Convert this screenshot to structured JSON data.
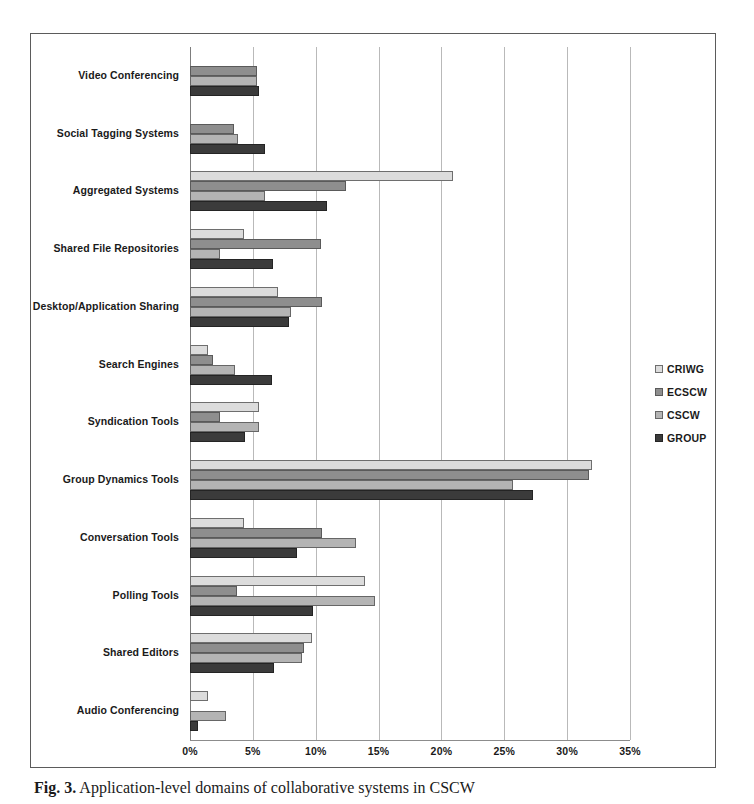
{
  "figure": {
    "caption_prefix": "Fig. 3.",
    "caption_text": "Application-level domains of collaborative systems in CSCW"
  },
  "legend": {
    "position": "right",
    "entries": [
      {
        "label": "CRIWG",
        "color": "#dcdcdc"
      },
      {
        "label": "ECSCW",
        "color": "#8e8e8e"
      },
      {
        "label": "CSCW",
        "color": "#b4b4b4"
      },
      {
        "label": "GROUP",
        "color": "#3b3b3b"
      }
    ]
  },
  "axis": {
    "ticks": [
      "0%",
      "5%",
      "10%",
      "15%",
      "20%",
      "25%",
      "30%",
      "35%"
    ],
    "min": 0,
    "max": 35
  },
  "chart_data": {
    "type": "bar",
    "orientation": "horizontal",
    "title": "",
    "xlabel": "",
    "ylabel": "",
    "xlim": [
      0,
      35
    ],
    "grid": true,
    "legend_position": "right",
    "categories": [
      "Video Conferencing",
      "Social Tagging Systems",
      "Aggregated Systems",
      "Shared File Repositories",
      "Desktop/Application Sharing",
      "Search Engines",
      "Syndication Tools",
      "Group Dynamics Tools",
      "Conversation Tools",
      "Polling Tools",
      "Shared Editors",
      "Audio Conferencing"
    ],
    "series": [
      {
        "name": "CRIWG",
        "values": [
          0.0,
          0.0,
          20.9,
          4.3,
          7.0,
          1.4,
          5.5,
          32.0,
          4.3,
          13.9,
          9.7,
          1.4
        ]
      },
      {
        "name": "ECSCW",
        "values": [
          5.3,
          3.5,
          12.4,
          10.4,
          10.5,
          1.8,
          2.4,
          31.7,
          10.5,
          3.7,
          9.1,
          0.0
        ]
      },
      {
        "name": "CSCW",
        "values": [
          5.3,
          3.8,
          6.0,
          2.4,
          8.0,
          3.6,
          5.5,
          25.7,
          13.2,
          14.7,
          8.9,
          2.9
        ]
      },
      {
        "name": "GROUP",
        "values": [
          5.5,
          6.0,
          10.9,
          6.6,
          7.9,
          6.5,
          4.4,
          27.3,
          8.5,
          9.8,
          6.7,
          0.6
        ]
      }
    ]
  }
}
